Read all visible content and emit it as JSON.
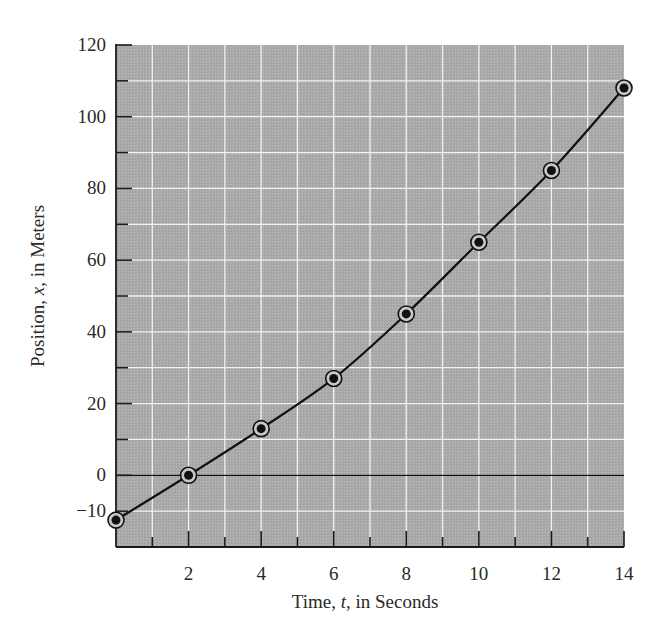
{
  "chart_data": {
    "type": "line",
    "title": "",
    "xlabel": "Time, t, in Seconds",
    "ylabel": "Position, x, in Meters",
    "xlabel_parts": [
      "Time, ",
      "t",
      ", in Seconds"
    ],
    "ylabel_parts": [
      "Position, ",
      "x",
      ", in Meters"
    ],
    "xlim": [
      0,
      14
    ],
    "ylim": [
      -20,
      120
    ],
    "x_ticks": [
      2,
      4,
      6,
      8,
      10,
      12,
      14
    ],
    "y_ticks": [
      -10,
      0,
      20,
      40,
      60,
      80,
      100,
      120
    ],
    "y_tick_labels": [
      "−10",
      "0",
      "20",
      "40",
      "60",
      "80",
      "100",
      "120"
    ],
    "grid": true,
    "grid_x_step": 1,
    "grid_y_step": 10,
    "legend": null,
    "series": [
      {
        "name": "Position vs. time",
        "marker": "circled-dot",
        "line": "smooth curve",
        "x": [
          0,
          2,
          4,
          6,
          8,
          10,
          12,
          14
        ],
        "values": [
          -12.5,
          0,
          13,
          27,
          45,
          65,
          85,
          108
        ]
      }
    ],
    "reference_lines": [
      {
        "axis": "y",
        "value": 0,
        "color": "#111111"
      }
    ]
  },
  "colors": {
    "plot_background": "#a9a9a9",
    "grid": "#f2f2f2",
    "line": "#111111",
    "axis": "#1a1a1a",
    "text": "#2a2a2a"
  }
}
